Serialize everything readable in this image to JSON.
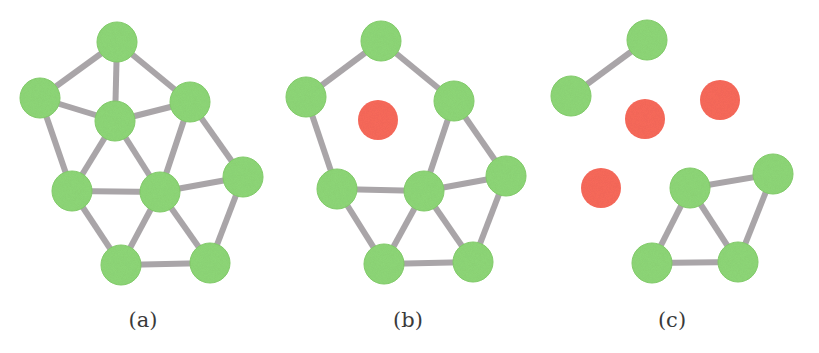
{
  "figure": {
    "colors": {
      "active_node": "#8fd878",
      "active_node_stroke": "#84cf6c",
      "removed_node": "#f96a5c",
      "edge": "#a9a5a8",
      "label": "#3a3a3a"
    },
    "node_radius": 20,
    "edge_width": 6,
    "panels": [
      {
        "id": "a",
        "label": "(a)",
        "label_x": 143,
        "nodes": [
          {
            "id": "top",
            "x": 117,
            "y": 42,
            "state": "active"
          },
          {
            "id": "ul",
            "x": 40,
            "y": 98,
            "state": "active"
          },
          {
            "id": "ur",
            "x": 190,
            "y": 102,
            "state": "active"
          },
          {
            "id": "center",
            "x": 115,
            "y": 121,
            "state": "active"
          },
          {
            "id": "midl",
            "x": 72,
            "y": 191,
            "state": "active"
          },
          {
            "id": "midc",
            "x": 160,
            "y": 192,
            "state": "active"
          },
          {
            "id": "midr",
            "x": 243,
            "y": 177,
            "state": "active"
          },
          {
            "id": "botl",
            "x": 121,
            "y": 265,
            "state": "active"
          },
          {
            "id": "botr",
            "x": 210,
            "y": 263,
            "state": "active"
          }
        ],
        "edges": [
          [
            "top",
            "ul"
          ],
          [
            "top",
            "center"
          ],
          [
            "top",
            "ur"
          ],
          [
            "ul",
            "center"
          ],
          [
            "center",
            "ur"
          ],
          [
            "ul",
            "midl"
          ],
          [
            "center",
            "midl"
          ],
          [
            "center",
            "midc"
          ],
          [
            "ur",
            "midc"
          ],
          [
            "ur",
            "midr"
          ],
          [
            "midl",
            "midc"
          ],
          [
            "midc",
            "midr"
          ],
          [
            "midl",
            "botl"
          ],
          [
            "midc",
            "botl"
          ],
          [
            "midc",
            "botr"
          ],
          [
            "midr",
            "botr"
          ],
          [
            "botl",
            "botr"
          ]
        ]
      },
      {
        "id": "b",
        "label": "(b)",
        "label_x": 408,
        "nodes": [
          {
            "id": "top",
            "x": 381,
            "y": 41,
            "state": "active"
          },
          {
            "id": "ul",
            "x": 306,
            "y": 97,
            "state": "active"
          },
          {
            "id": "ur",
            "x": 454,
            "y": 101,
            "state": "active"
          },
          {
            "id": "center",
            "x": 378,
            "y": 120,
            "state": "removed"
          },
          {
            "id": "midl",
            "x": 337,
            "y": 189,
            "state": "active"
          },
          {
            "id": "midc",
            "x": 424,
            "y": 191,
            "state": "active"
          },
          {
            "id": "midr",
            "x": 506,
            "y": 176,
            "state": "active"
          },
          {
            "id": "botl",
            "x": 384,
            "y": 264,
            "state": "active"
          },
          {
            "id": "botr",
            "x": 473,
            "y": 262,
            "state": "active"
          }
        ],
        "edges": [
          [
            "top",
            "ul"
          ],
          [
            "top",
            "ur"
          ],
          [
            "ul",
            "midl"
          ],
          [
            "ur",
            "midc"
          ],
          [
            "ur",
            "midr"
          ],
          [
            "midl",
            "midc"
          ],
          [
            "midc",
            "midr"
          ],
          [
            "midl",
            "botl"
          ],
          [
            "midc",
            "botl"
          ],
          [
            "midc",
            "botr"
          ],
          [
            "midr",
            "botr"
          ],
          [
            "botl",
            "botr"
          ]
        ]
      },
      {
        "id": "c",
        "label": "(c)",
        "label_x": 672,
        "nodes": [
          {
            "id": "top",
            "x": 647,
            "y": 40,
            "state": "active"
          },
          {
            "id": "ul",
            "x": 571,
            "y": 96,
            "state": "active"
          },
          {
            "id": "ur",
            "x": 720,
            "y": 100,
            "state": "removed"
          },
          {
            "id": "center",
            "x": 645,
            "y": 119,
            "state": "removed"
          },
          {
            "id": "midl",
            "x": 601,
            "y": 188,
            "state": "removed"
          },
          {
            "id": "midc",
            "x": 690,
            "y": 188,
            "state": "active"
          },
          {
            "id": "midr",
            "x": 773,
            "y": 174,
            "state": "active"
          },
          {
            "id": "botl",
            "x": 652,
            "y": 263,
            "state": "active"
          },
          {
            "id": "botr",
            "x": 738,
            "y": 262,
            "state": "active"
          }
        ],
        "edges": [
          [
            "top",
            "ul"
          ],
          [
            "midc",
            "midr"
          ],
          [
            "midc",
            "botl"
          ],
          [
            "midc",
            "botr"
          ],
          [
            "midr",
            "botr"
          ],
          [
            "botl",
            "botr"
          ]
        ]
      }
    ]
  },
  "labels": {
    "a": "(a)",
    "b": "(b)",
    "c": "(c)"
  }
}
